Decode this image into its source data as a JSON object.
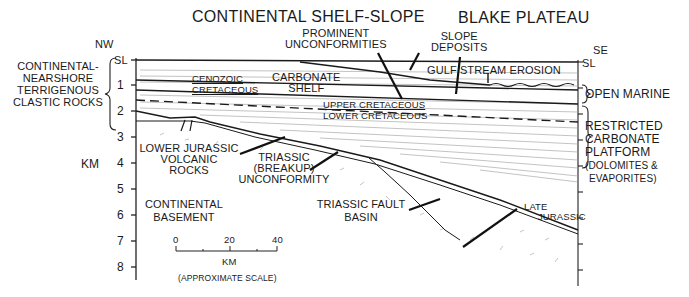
{
  "titles": {
    "left": "CONTINENTAL SHELF-SLOPE",
    "right": "BLAKE PLATEAU"
  },
  "orientation": {
    "left": "NW",
    "right": "SE"
  },
  "sea_level": {
    "left": "SL",
    "right": "SL"
  },
  "axis": {
    "label": "KM",
    "ticks": [
      "1",
      "2",
      "3",
      "4",
      "5",
      "6",
      "7",
      "8"
    ]
  },
  "left_bracket_label": [
    "CONTINENTAL-",
    "NEARSHORE",
    "TERRIGENOUS",
    "CLASTIC ROCKS"
  ],
  "right_brackets": {
    "open_marine": "OPEN MARINE",
    "restricted": [
      "RESTRICTED",
      "CARBONATE",
      "PLATFORM",
      "(DOLOMITES &",
      "EVAPORITES)"
    ]
  },
  "labels": {
    "prominent_unconformities": [
      "PROMINENT",
      "UNCONFORMITIES"
    ],
    "slope_deposits": [
      "SLOPE",
      "DEPOSITS"
    ],
    "gulf_stream_erosion": "GULF STREAM EROSION",
    "cenozoic": "CENOZOIC",
    "cretaceous": "CRETACEOUS",
    "carbonate_shelf": [
      "CARBONATE",
      "SHELF"
    ],
    "upper_cretaceous": "UPPER CRETACEOUS",
    "lower_cretaceous": "LOWER CRETACEOUS",
    "lower_jurassic": [
      "LOWER JURASSIC",
      "VOLCANIC",
      "ROCKS"
    ],
    "triassic_unconformity": [
      "TRIASSIC",
      "(BREAKUP)",
      "UNCONFORMITY"
    ],
    "continental_basement": [
      "CONTINENTAL",
      "BASEMENT"
    ],
    "triassic_fault_basin": [
      "TRIASSIC FAULT",
      "BASIN"
    ],
    "late_jurassic": [
      "LATE",
      "JURASSIC"
    ]
  },
  "scale_bar": {
    "ticks": [
      "0",
      "20",
      "40"
    ],
    "unit": "KM",
    "note": "(APPROXIMATE SCALE)"
  }
}
